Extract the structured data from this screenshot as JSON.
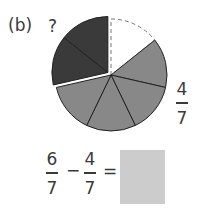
{
  "label": "(b)",
  "question_mark": "?",
  "pie": {
    "denominator": 7,
    "center": [
      111,
      75
    ],
    "radius": 56,
    "slices": [
      {
        "name": "removed",
        "count": 1,
        "fill": "#ffffff",
        "style": "dashed"
      },
      {
        "name": "shaded",
        "count": 4,
        "fill": "#888888",
        "style": "solid"
      },
      {
        "name": "unknown",
        "count": 2,
        "fill": "#3a3a3a",
        "style": "solid",
        "exploded": true
      }
    ],
    "colors": {
      "gray": "#888888",
      "dark": "#3a3a3a",
      "outline": "#222222",
      "dash": "#777777"
    }
  },
  "side_fraction": {
    "numerator": "4",
    "denominator": "7"
  },
  "equation": {
    "first": {
      "numerator": "6",
      "denominator": "7"
    },
    "minus": "−",
    "second": {
      "numerator": "4",
      "denominator": "7"
    },
    "equals": "=",
    "answer": ""
  }
}
